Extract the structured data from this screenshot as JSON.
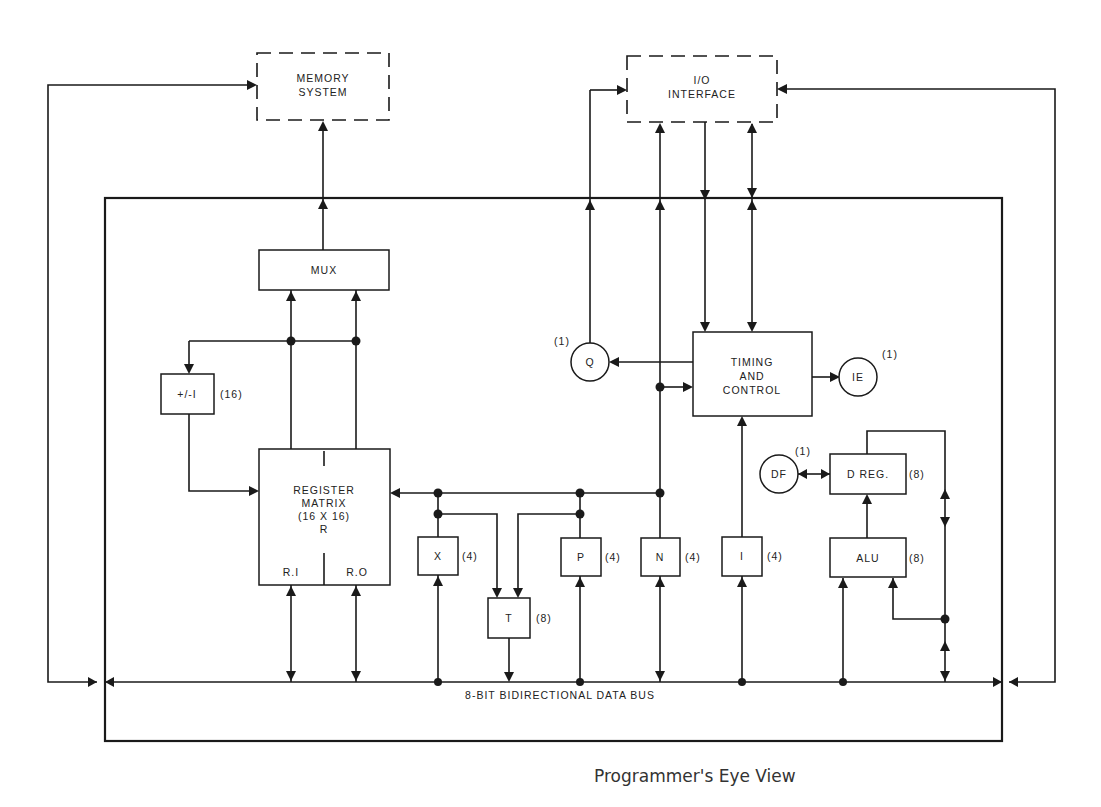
{
  "diagram": {
    "caption": "Programmer's Eye View",
    "external": {
      "memory": {
        "line1": "MEMORY",
        "line2": "SYSTEM"
      },
      "io": {
        "line1": "I/O",
        "line2": "INTERFACE"
      }
    },
    "blocks": {
      "mux": "MUX",
      "incdec": "+/-I",
      "incdec_size": "(16)",
      "register_matrix": {
        "line1": "REGISTER",
        "line2": "MATRIX",
        "line3": "(16 X 16)",
        "line4": "R",
        "ri": "R.I",
        "ro": "R.O"
      },
      "timing": {
        "line1": "TIMING",
        "line2": "AND",
        "line3": "CONTROL"
      },
      "x": "X",
      "x_size": "(4)",
      "t": "T",
      "t_size": "(8)",
      "p": "P",
      "p_size": "(4)",
      "n": "N",
      "n_size": "(4)",
      "i": "I",
      "i_size": "(4)",
      "alu": "ALU",
      "alu_size": "(8)",
      "dreg": "D REG.",
      "dreg_size": "(8)"
    },
    "flags": {
      "q": "Q",
      "q_size": "(1)",
      "ie": "IE",
      "ie_size": "(1)",
      "df": "DF",
      "df_size": "(1)"
    },
    "bus_label": "8-BIT BIDIRECTIONAL DATA BUS"
  }
}
